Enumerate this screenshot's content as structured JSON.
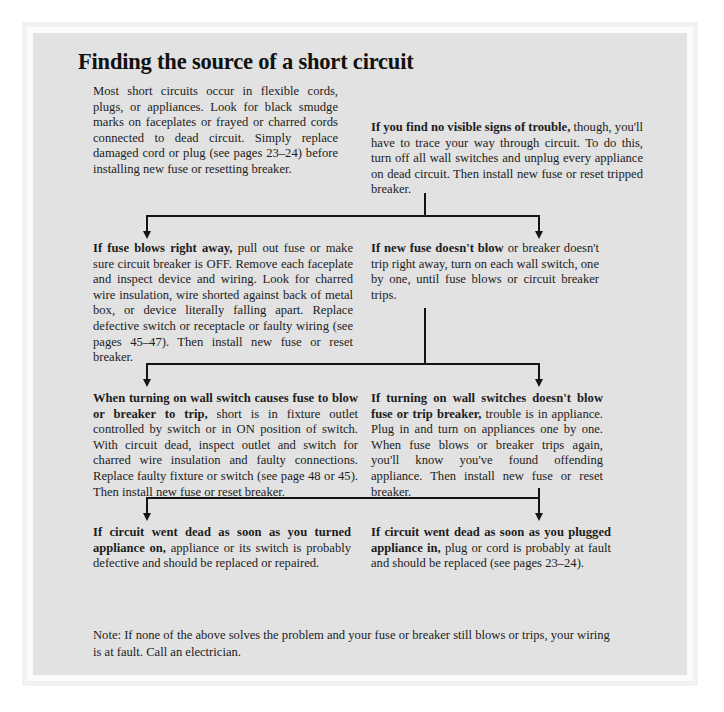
{
  "page": {
    "title": "Finding the source of a short circuit",
    "background_color": "#e2e2e2",
    "text_color": "#1c1c1c",
    "rule_color": "#141414"
  },
  "intro": {
    "text": "Most short circuits occur in flexible cords, plugs, or appliances. Look for black smudge marks on faceplates or frayed or charred cords connected to dead circuit. Simply replace damaged cord or plug (see pages 23–24) before installing new fuse or resetting breaker."
  },
  "flow": {
    "top_right": {
      "lead": "If you find no visible signs of trouble,",
      "rest": " though, you'll have to trace your way through circuit. To do this, turn off all wall switches and unplug every appliance on dead circuit. Then install new fuse or reset tripped breaker."
    },
    "row1_left": {
      "lead": "If fuse blows right away,",
      "rest": " pull out fuse or make sure circuit breaker is OFF. Remove each faceplate and inspect device and wiring. Look for charred wire insulation, wire shorted against back of metal box, or device literally falling apart. Replace defective switch or receptacle or faulty wiring (see pages 45–47). Then install new fuse or reset breaker."
    },
    "row1_right": {
      "lead": "If new fuse doesn't blow",
      "rest": " or breaker doesn't trip right away, turn on each wall switch, one by one, until fuse blows or circuit breaker trips."
    },
    "row2_left": {
      "lead": "When turning on wall switch causes fuse to blow or breaker to trip,",
      "rest": " short is in fixture outlet controlled by switch or in ON position of switch. With circuit dead, inspect outlet and switch for charred wire insulation and faulty connections. Replace faulty fixture or switch (see page 48 or 45). Then install new fuse or reset breaker."
    },
    "row2_right": {
      "lead": "If turning on wall switches doesn't blow fuse or trip breaker,",
      "rest": " trouble is in appliance. Plug in and turn on appliances one by one. When fuse blows or breaker trips again, you'll know you've found offending appliance. Then install new fuse or reset breaker."
    },
    "row3_left": {
      "lead": "If circuit went dead as soon as you turned appliance on,",
      "rest": " appliance or its switch is probably defective and should be replaced or repaired."
    },
    "row3_right": {
      "lead": "If circuit went dead as soon as you plugged appliance in,",
      "rest": " plug or cord is probably at fault and should be replaced (see pages 23–24)."
    }
  },
  "footer": {
    "note": "Note: If none of the above solves the problem and your fuse or breaker still blows or trips, your wiring is at fault. Call an electrician."
  }
}
